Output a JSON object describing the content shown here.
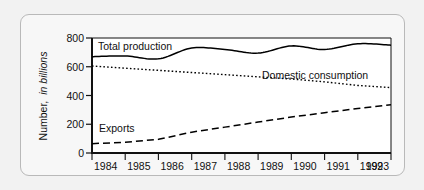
{
  "chart_data": {
    "type": "line",
    "title": "",
    "xlabel": "",
    "ylabel": "Number, in billions",
    "ylabel_plain": "Number,",
    "ylabel_italic": "in billions",
    "x": [
      1984,
      1985,
      1986,
      1987,
      1988,
      1989,
      1990,
      1991,
      1992,
      1993
    ],
    "categories": [
      "1984",
      "1985",
      "1986",
      "1987",
      "1988",
      "1989",
      "1990",
      "1991",
      "1992",
      "1993"
    ],
    "xlim": [
      1984,
      1993
    ],
    "ylim": [
      0,
      800
    ],
    "yticks": [
      0,
      200,
      400,
      600,
      800
    ],
    "ytick_labels": [
      "0",
      "200",
      "400",
      "600",
      "800"
    ],
    "grid": false,
    "legend": "inline-labels",
    "series": [
      {
        "name": "Total production",
        "label": "Total production",
        "style": "solid",
        "color": "#000000",
        "values": [
          670,
          675,
          655,
          730,
          720,
          695,
          745,
          720,
          760,
          750
        ]
      },
      {
        "name": "Domestic consumption",
        "label": "Domestic consumption",
        "style": "dotted",
        "color": "#000000",
        "values": [
          605,
          590,
          575,
          560,
          545,
          530,
          515,
          495,
          470,
          455
        ]
      },
      {
        "name": "Exports",
        "label": "Exports",
        "style": "dashed",
        "color": "#000000",
        "values": [
          65,
          75,
          95,
          145,
          180,
          215,
          250,
          280,
          310,
          335
        ]
      }
    ],
    "annotations": [
      {
        "text": "Total production",
        "near_series": "Total production"
      },
      {
        "text": "Domestic consumption",
        "near_series": "Domestic consumption"
      },
      {
        "text": "Exports",
        "near_series": "Exports"
      }
    ]
  }
}
